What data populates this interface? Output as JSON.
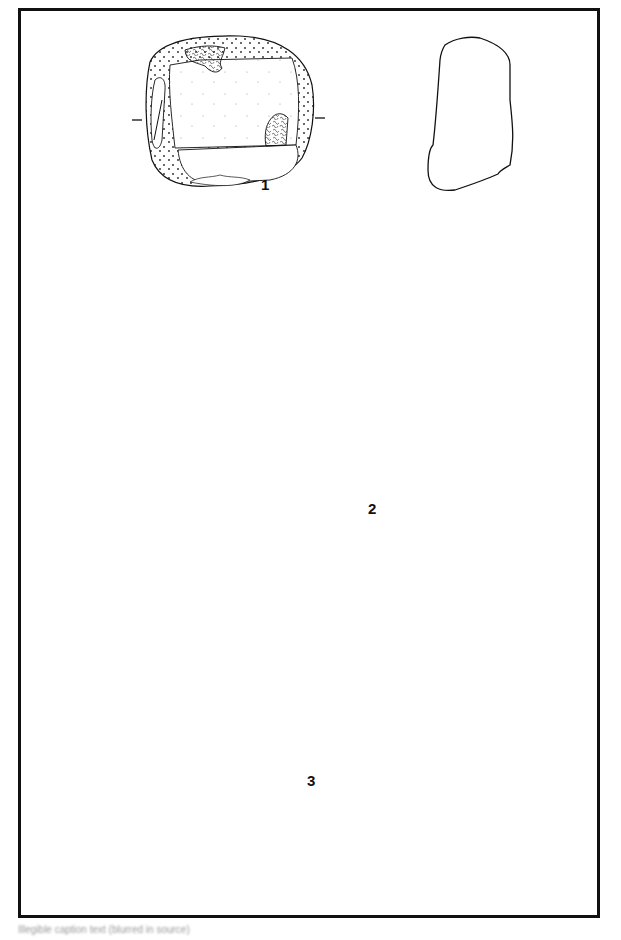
{
  "plate": {
    "figures": [
      {
        "number": "1",
        "views": [
          "front-face",
          "side-profile",
          "top-section"
        ]
      },
      {
        "number": "2",
        "views": [
          "front-face",
          "side-profile",
          "top-section"
        ]
      },
      {
        "number": "3",
        "views": [
          "front-face",
          "side-profile",
          "top-section"
        ]
      }
    ],
    "caption": "Illegible caption text (blurred in source)"
  },
  "colors": {
    "line": "#111111",
    "background": "#ffffff",
    "stipple": "#333333"
  }
}
